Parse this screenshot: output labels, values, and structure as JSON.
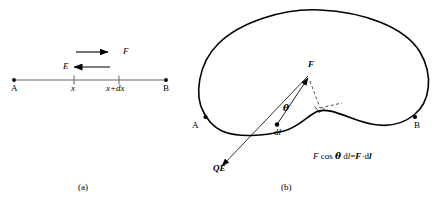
{
  "figure": {
    "caption_a": "(a)",
    "caption_b": "(b)",
    "stroke_color": "#000000",
    "background": "#ffffff"
  },
  "panel_a": {
    "name": "one-dimensional-axis-diagram",
    "endpoint_left_label": "A",
    "endpoint_right_label": "B",
    "tick_left_label": "x",
    "tick_right_label": "x+dx",
    "force_arrow_label": "F",
    "field_arrow_label": "E",
    "force_arrow_direction": "right",
    "field_arrow_direction": "left"
  },
  "panel_b": {
    "name": "closed-loop-path-diagram",
    "point_a_label": "A",
    "point_b_label": "B",
    "force_vector_label": "F",
    "charge_field_vector_label": "QE",
    "angle_label": "θ",
    "segment_label_prefix": "d",
    "segment_label_italic": "l",
    "formula": "F cos θ dl=F·dl",
    "formula_parts": {
      "f1": "F",
      "cos": "cos",
      "theta": "θ",
      "dl1_d": "d",
      "dl1_l": "l",
      "equals": "=",
      "f2": "F",
      "dot": "·",
      "dl2_d": "d",
      "dl2_l": "l"
    }
  }
}
